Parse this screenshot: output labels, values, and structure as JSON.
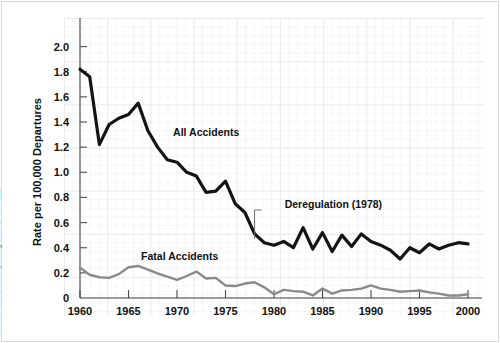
{
  "figure": {
    "source_note": "SOURCE: National Transportation Safety Board, www.nstb.gov, accessed October 2001. Data are for all scheduled service of U.S. airlines operating under 14 CFR 121."
  },
  "chart_data": {
    "type": "line",
    "title": "",
    "xlabel": "",
    "ylabel": "Rate per 100,000 Departures",
    "xlim": [
      1960,
      2000
    ],
    "ylim": [
      0,
      2.1
    ],
    "grid": true,
    "legend_position": "inline-labels",
    "ytick_labels": [
      "0",
      "0.2",
      "0.4",
      "0.6",
      "0.8",
      "1.0",
      "1.2",
      "1.4",
      "1.6",
      "1.8",
      "2.0"
    ],
    "ytick_values": [
      0,
      0.2,
      0.4,
      0.6,
      0.8,
      1.0,
      1.2,
      1.4,
      1.6,
      1.8,
      2.0
    ],
    "xtick_labels": [
      "1960",
      "1965",
      "1970",
      "1975",
      "1980",
      "1985",
      "1990",
      "1995",
      "2000"
    ],
    "xtick_values": [
      1960,
      1965,
      1970,
      1975,
      1980,
      1985,
      1990,
      1995,
      2000
    ],
    "x": [
      1960,
      1961,
      1962,
      1963,
      1964,
      1965,
      1966,
      1967,
      1968,
      1969,
      1970,
      1971,
      1972,
      1973,
      1974,
      1975,
      1976,
      1977,
      1978,
      1979,
      1980,
      1981,
      1982,
      1983,
      1984,
      1985,
      1986,
      1987,
      1988,
      1989,
      1990,
      1991,
      1992,
      1993,
      1994,
      1995,
      1996,
      1997,
      1998,
      1999,
      2000
    ],
    "series": [
      {
        "name": "All Accidents",
        "color": "#141414",
        "width": 3.2,
        "label_x": 1969.6,
        "label_y": 1.29,
        "values": [
          1.82,
          1.76,
          1.22,
          1.38,
          1.43,
          1.46,
          1.55,
          1.33,
          1.2,
          1.1,
          1.08,
          1.0,
          0.97,
          0.84,
          0.85,
          0.93,
          0.75,
          0.68,
          0.51,
          0.44,
          0.42,
          0.45,
          0.4,
          0.56,
          0.39,
          0.52,
          0.37,
          0.5,
          0.41,
          0.51,
          0.45,
          0.42,
          0.38,
          0.31,
          0.4,
          0.36,
          0.43,
          0.39,
          0.42,
          0.44,
          0.43
        ]
      },
      {
        "name": "Fatal Accidents",
        "color": "#8a8a8a",
        "width": 2.4,
        "label_x": 1966.3,
        "label_y": 0.305,
        "values": [
          0.24,
          0.185,
          0.165,
          0.16,
          0.19,
          0.245,
          0.255,
          0.225,
          0.195,
          0.17,
          0.145,
          0.175,
          0.21,
          0.155,
          0.16,
          0.1,
          0.095,
          0.115,
          0.125,
          0.085,
          0.03,
          0.065,
          0.055,
          0.05,
          0.02,
          0.075,
          0.035,
          0.06,
          0.065,
          0.075,
          0.1,
          0.075,
          0.065,
          0.05,
          0.055,
          0.06,
          0.045,
          0.035,
          0.02,
          0.02,
          0.03
        ]
      }
    ],
    "annotations": [
      {
        "text": "Deregulation (1978)",
        "year": 1978,
        "text_x": 1981.1,
        "text_y": 0.73,
        "leader_y_top": 0.7,
        "leader_y_bottom": 0.47
      }
    ]
  }
}
